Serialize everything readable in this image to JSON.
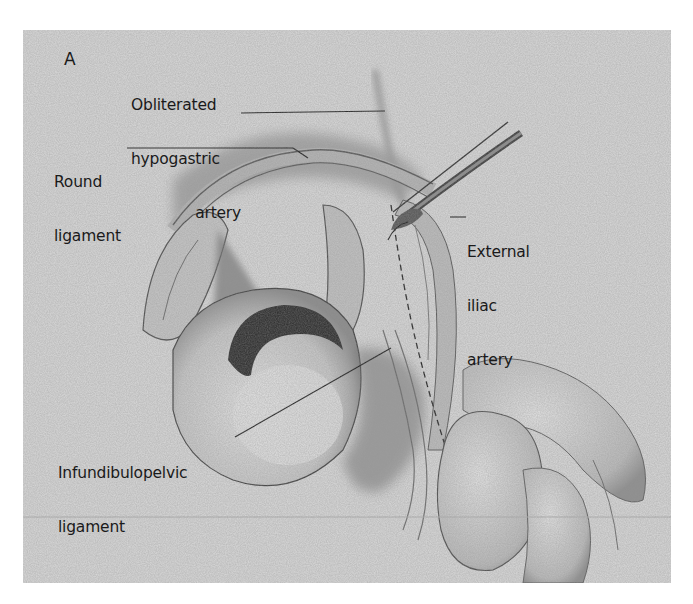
{
  "figure": {
    "panel_letter": "A",
    "background_color": "#dcdcdc",
    "ink_color": "#1a1a1a",
    "labels": [
      {
        "id": "obliterated-hypogastric-artery",
        "lines": [
          "Obliterated",
          "hypogastric",
          "artery"
        ]
      },
      {
        "id": "round-ligament",
        "lines": [
          "Round",
          "ligament"
        ]
      },
      {
        "id": "external-iliac-artery",
        "lines": [
          "External",
          "iliac",
          "artery"
        ]
      },
      {
        "id": "infundibulopelvic-ligament",
        "lines": [
          "Infundibulopelvic",
          "ligament"
        ]
      }
    ],
    "instruments": [
      "forceps"
    ]
  }
}
